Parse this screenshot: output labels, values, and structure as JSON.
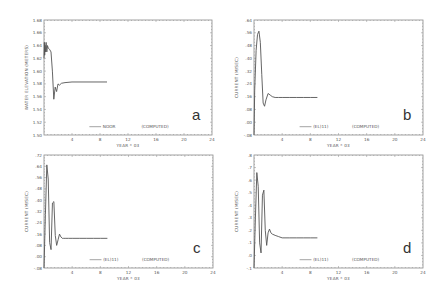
{
  "figure": {
    "panels": [
      {
        "id": "a",
        "letter": "a",
        "frame": {
          "x0": 44,
          "y0": 20,
          "x1": 212,
          "y1": 135
        },
        "ylabel": "WATER ELEVATION (METERS)",
        "xlabel": "YEAR * 03",
        "legend": {
          "series_label": "NOOR",
          "computed_label": "(COMPUTED)"
        },
        "x_ticks": [
          "4",
          "8",
          "12",
          "16",
          "20",
          "24"
        ],
        "y_ticks": [
          "1.68",
          "1.66",
          "1.64",
          "1.62",
          "1.60",
          "1.58",
          "1.56",
          "1.54",
          "1.52",
          "1.50"
        ]
      },
      {
        "id": "b",
        "letter": "b",
        "frame": {
          "x0": 254,
          "y0": 20,
          "x1": 423,
          "y1": 135
        },
        "ylabel": "CURRENT (M/SEC)",
        "xlabel": "YEAR * 03",
        "legend": {
          "series_label": "(EL)11)",
          "computed_label": "(COMPUTED)"
        },
        "x_ticks": [
          "4",
          "8",
          "12",
          "16",
          "20",
          "24"
        ],
        "y_ticks": [
          ".64",
          ".56",
          ".48",
          ".40",
          ".32",
          ".24",
          ".16",
          ".08",
          ".00",
          "-.08"
        ]
      },
      {
        "id": "c",
        "letter": "c",
        "frame": {
          "x0": 44,
          "y0": 155,
          "x1": 213,
          "y1": 268
        },
        "ylabel": "CURRENT (M/SEC)",
        "xlabel": "YEAR * 03",
        "legend": {
          "series_label": "(EL)11)",
          "computed_label": "(COMPUTED)"
        },
        "x_ticks": [
          "4",
          "8",
          "12",
          "16",
          "20",
          "24"
        ],
        "y_ticks": [
          ".72",
          ".64",
          ".56",
          ".48",
          ".40",
          ".32",
          ".24",
          ".16",
          ".08",
          ".00",
          "-.08"
        ]
      },
      {
        "id": "d",
        "letter": "d",
        "frame": {
          "x0": 254,
          "y0": 155,
          "x1": 423,
          "y1": 268
        },
        "ylabel": "CURRENT (M/SEC)",
        "xlabel": "YEAR * 03",
        "legend": {
          "series_label": "(EL)11)",
          "computed_label": "(COMPUTED)"
        },
        "x_ticks": [
          "4",
          "8",
          "12",
          "16",
          "20",
          "24"
        ],
        "y_ticks": [
          ".8",
          ".7",
          ".6",
          ".5",
          ".4",
          ".3",
          ".2",
          ".1",
          ".0",
          "-.1"
        ]
      }
    ]
  },
  "chart_data": [
    {
      "type": "line",
      "panel": "a",
      "title": "",
      "xlabel": "YEAR * 03",
      "ylabel": "WATER ELEVATION (METERS)",
      "xlim": [
        0,
        24
      ],
      "ylim": [
        1.5,
        1.68
      ],
      "legend": [
        "NOOR",
        "(COMPUTED)"
      ],
      "grid": false,
      "series": [
        {
          "name": "NOOR (COMPUTED)",
          "x": [
            0,
            0.05,
            0.1,
            0.15,
            0.2,
            0.3,
            0.4,
            0.5,
            0.6,
            0.8,
            1.0,
            1.2,
            1.4,
            1.6,
            1.8,
            2.0,
            2.2,
            2.5,
            3.0,
            4.0,
            5.0,
            6.0,
            7.0,
            8.0,
            9.0
          ],
          "y": [
            1.62,
            1.645,
            1.625,
            1.64,
            1.63,
            1.645,
            1.63,
            1.64,
            1.636,
            1.634,
            1.63,
            1.6,
            1.556,
            1.575,
            1.568,
            1.58,
            1.578,
            1.581,
            1.582,
            1.583,
            1.583,
            1.583,
            1.583,
            1.583,
            1.583
          ]
        }
      ]
    },
    {
      "type": "line",
      "panel": "b",
      "title": "",
      "xlabel": "YEAR * 03",
      "ylabel": "CURRENT (M/SEC)",
      "xlim": [
        0,
        24
      ],
      "ylim": [
        -0.08,
        0.64
      ],
      "legend": [
        "(EL)11)",
        "(COMPUTED)"
      ],
      "grid": false,
      "series": [
        {
          "name": "(EL)11) (COMPUTED)",
          "x": [
            0,
            0.1,
            0.3,
            0.5,
            0.7,
            0.9,
            1.1,
            1.3,
            1.5,
            1.7,
            2.0,
            2.3,
            2.6,
            3.0,
            3.5,
            4.0,
            5.0,
            6.0,
            7.0,
            8.0,
            9.0
          ],
          "y": [
            -0.08,
            0.2,
            0.45,
            0.55,
            0.57,
            0.5,
            0.3,
            0.12,
            0.1,
            0.14,
            0.18,
            0.17,
            0.16,
            0.155,
            0.155,
            0.155,
            0.155,
            0.155,
            0.155,
            0.155,
            0.155
          ]
        }
      ]
    },
    {
      "type": "line",
      "panel": "c",
      "title": "",
      "xlabel": "YEAR * 03",
      "ylabel": "CURRENT (M/SEC)",
      "xlim": [
        0,
        24
      ],
      "ylim": [
        -0.08,
        0.72
      ],
      "legend": [
        "(EL)11)",
        "(COMPUTED)"
      ],
      "grid": false,
      "series": [
        {
          "name": "(EL)11) (COMPUTED)",
          "x": [
            0,
            0.2,
            0.4,
            0.6,
            0.8,
            1.0,
            1.2,
            1.4,
            1.6,
            1.8,
            2.0,
            2.2,
            2.4,
            2.6,
            2.8,
            3.0,
            3.5,
            4.0,
            5.0,
            6.0,
            7.0,
            8.0,
            9.0
          ],
          "y": [
            -0.08,
            0.3,
            0.65,
            0.55,
            0.1,
            0.05,
            0.38,
            0.39,
            0.15,
            0.08,
            0.12,
            0.16,
            0.14,
            0.13,
            0.13,
            0.13,
            0.13,
            0.13,
            0.13,
            0.13,
            0.13,
            0.13,
            0.13
          ]
        }
      ]
    },
    {
      "type": "line",
      "panel": "d",
      "title": "",
      "xlabel": "YEAR * 03",
      "ylabel": "CURRENT (M/SEC)",
      "xlim": [
        0,
        24
      ],
      "ylim": [
        -0.1,
        0.8
      ],
      "legend": [
        "(EL)11)",
        "(COMPUTED)"
      ],
      "grid": false,
      "series": [
        {
          "name": "(EL)11) (COMPUTED)",
          "x": [
            0,
            0.2,
            0.4,
            0.6,
            0.8,
            1.0,
            1.2,
            1.4,
            1.6,
            1.8,
            2.0,
            2.2,
            2.4,
            2.6,
            3.0,
            3.5,
            4.0,
            5.0,
            6.0,
            7.0,
            8.0,
            9.0
          ],
          "y": [
            -0.1,
            0.3,
            0.66,
            0.55,
            0.1,
            0.02,
            0.48,
            0.52,
            0.2,
            0.08,
            0.18,
            0.21,
            0.18,
            0.17,
            0.16,
            0.15,
            0.14,
            0.14,
            0.14,
            0.14,
            0.14,
            0.14
          ]
        }
      ]
    }
  ]
}
